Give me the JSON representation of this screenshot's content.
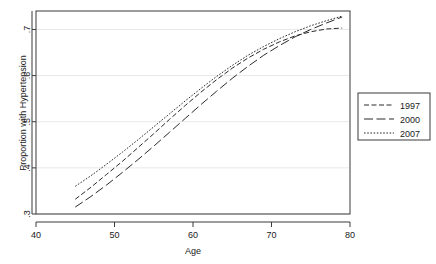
{
  "chart_data": {
    "type": "line",
    "title": "",
    "xlabel": "Age",
    "ylabel": "Proportion with Hypertension",
    "xlim": [
      40,
      80
    ],
    "ylim": [
      0.3,
      0.74
    ],
    "xticks": [
      40,
      50,
      60,
      70,
      80
    ],
    "xtick_labels": [
      "40",
      "50",
      "60",
      "70",
      "80"
    ],
    "yticks": [
      0.3,
      0.4,
      0.5,
      0.6,
      0.7
    ],
    "ytick_labels": [
      ".3",
      ".4",
      ".5",
      ".6",
      ".7"
    ],
    "grid": "horizontal",
    "legend_position": "right-outside",
    "x": [
      45,
      47,
      49,
      51,
      53,
      55,
      57,
      59,
      61,
      63,
      65,
      67,
      69,
      71,
      73,
      75,
      77,
      79
    ],
    "series": [
      {
        "name": "1997",
        "dash": "medium-dash",
        "values": [
          0.332,
          0.358,
          0.386,
          0.414,
          0.444,
          0.474,
          0.505,
          0.535,
          0.564,
          0.591,
          0.616,
          0.638,
          0.657,
          0.673,
          0.686,
          0.695,
          0.701,
          0.703
        ]
      },
      {
        "name": "2000",
        "dash": "long-dash",
        "values": [
          0.315,
          0.338,
          0.363,
          0.39,
          0.418,
          0.447,
          0.477,
          0.507,
          0.537,
          0.566,
          0.594,
          0.62,
          0.644,
          0.665,
          0.684,
          0.7,
          0.714,
          0.727
        ]
      },
      {
        "name": "2007",
        "dash": "dotted",
        "values": [
          0.36,
          0.383,
          0.408,
          0.434,
          0.461,
          0.489,
          0.517,
          0.545,
          0.572,
          0.598,
          0.622,
          0.644,
          0.663,
          0.68,
          0.695,
          0.708,
          0.719,
          0.729
        ]
      }
    ]
  },
  "legend": {
    "entries": [
      {
        "label": "1997"
      },
      {
        "label": "2000"
      },
      {
        "label": "2007"
      }
    ]
  }
}
